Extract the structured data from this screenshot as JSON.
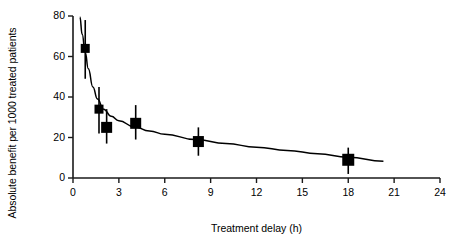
{
  "chart_data": {
    "type": "scatter",
    "title": "",
    "subtitle": "",
    "xlabel": "Treatment delay (h)",
    "ylabel": "Absolute benefit per 1000 treated patients",
    "xlim": [
      0,
      24
    ],
    "ylim": [
      0,
      80
    ],
    "xticks": [
      0,
      3,
      6,
      9,
      12,
      15,
      18,
      21,
      24
    ],
    "yticks": [
      0,
      20,
      40,
      60,
      80
    ],
    "xtick_labels": [
      "0",
      "3",
      "6",
      "9",
      "12",
      "15",
      "18",
      "21",
      "24"
    ],
    "ytick_labels": [
      "0",
      "20",
      "40",
      "60",
      "80"
    ],
    "grid": false,
    "legend": null,
    "marker_style": "filled-square",
    "marker_color": "#000000",
    "errorbar_style": "vertical-capless",
    "points": [
      {
        "x": 0.8,
        "y": 64,
        "y_low": 49,
        "y_high": 78,
        "marker_size": 9
      },
      {
        "x": 1.7,
        "y": 34,
        "y_low": 22,
        "y_high": 45,
        "marker_size": 9
      },
      {
        "x": 2.2,
        "y": 25,
        "y_low": 17,
        "y_high": 34,
        "marker_size": 11
      },
      {
        "x": 4.1,
        "y": 27,
        "y_low": 19,
        "y_high": 36,
        "marker_size": 11
      },
      {
        "x": 8.2,
        "y": 18,
        "y_low": 11,
        "y_high": 25,
        "marker_size": 11
      },
      {
        "x": 18.0,
        "y": 9,
        "y_low": 2,
        "y_high": 15,
        "marker_size": 12
      }
    ],
    "fit_curve": {
      "description": "fitted decaying curve through data points",
      "x_start": 0.45,
      "x_end": 20.3,
      "points": [
        {
          "x": 0.45,
          "y": 79.5
        },
        {
          "x": 0.6,
          "y": 71.0
        },
        {
          "x": 0.8,
          "y": 62.0
        },
        {
          "x": 1.0,
          "y": 54.0
        },
        {
          "x": 1.3,
          "y": 45.0
        },
        {
          "x": 1.6,
          "y": 39.0
        },
        {
          "x": 2.0,
          "y": 34.0
        },
        {
          "x": 2.5,
          "y": 30.5
        },
        {
          "x": 3.0,
          "y": 28.3
        },
        {
          "x": 4.0,
          "y": 25.3
        },
        {
          "x": 5.0,
          "y": 23.2
        },
        {
          "x": 6.0,
          "y": 21.6
        },
        {
          "x": 8.0,
          "y": 19.0
        },
        {
          "x": 10.0,
          "y": 17.0
        },
        {
          "x": 12.0,
          "y": 15.2
        },
        {
          "x": 14.0,
          "y": 13.6
        },
        {
          "x": 16.0,
          "y": 12.0
        },
        {
          "x": 18.0,
          "y": 10.3
        },
        {
          "x": 20.3,
          "y": 8.3
        }
      ]
    }
  },
  "axes": {
    "x_label_text": "Treatment delay (h)",
    "y_label_text": "Absolute benefit per 1000 treated patients"
  }
}
